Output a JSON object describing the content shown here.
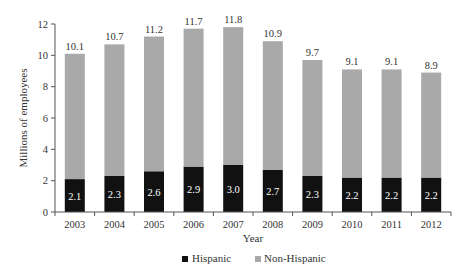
{
  "chart_data": {
    "type": "bar",
    "stacked": true,
    "title": "",
    "xlabel": "Year",
    "ylabel": "Millions of employees",
    "ylim": [
      0,
      12
    ],
    "yticks": [
      0,
      2,
      4,
      6,
      8,
      10,
      12
    ],
    "grid": false,
    "legend_position": "bottom-center",
    "categories": [
      "2003",
      "2004",
      "2005",
      "2006",
      "2007",
      "2008",
      "2009",
      "2010",
      "2011",
      "2012"
    ],
    "series": [
      {
        "name": "Hispanic",
        "color": "#111111",
        "values": [
          2.1,
          2.3,
          2.6,
          2.9,
          3.0,
          2.7,
          2.3,
          2.2,
          2.2,
          2.2
        ]
      },
      {
        "name": "Non-Hispanic",
        "color": "#a9a9a9",
        "values": [
          8.0,
          8.4,
          8.6,
          8.8,
          8.8,
          8.2,
          7.4,
          6.9,
          6.9,
          6.7
        ]
      }
    ],
    "hispanic_labels": [
      "2.1",
      "2.3",
      "2.6",
      "2.9",
      "3.0",
      "2.7",
      "2.3",
      "2.2",
      "2.2",
      "2.2"
    ],
    "total_labels": [
      "10.1",
      "10.7",
      "11.2",
      "11.7",
      "11.8",
      "10.9",
      "9.7",
      "9.1",
      "9.1",
      "8.9"
    ],
    "totals": [
      10.1,
      10.7,
      11.2,
      11.7,
      11.8,
      10.9,
      9.7,
      9.1,
      9.1,
      8.9
    ]
  }
}
